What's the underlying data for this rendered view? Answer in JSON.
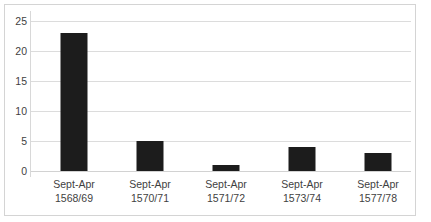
{
  "chart_data": {
    "type": "bar",
    "title": "",
    "xlabel": "",
    "ylabel": "",
    "ylim": [
      0,
      25
    ],
    "yticks": [
      0,
      5,
      10,
      15,
      20,
      25
    ],
    "grid": true,
    "legend": false,
    "categories": [
      "Sept-Apr 1568/69",
      "Sept-Apr 1570/71",
      "Sept-Apr 1571/72",
      "Sept-Apr 1573/74",
      "Sept-Apr 1577/78"
    ],
    "values": [
      23,
      5,
      1,
      4,
      3
    ],
    "bar_color": "#1c1c1c",
    "gridline_color": "#dcdcdc",
    "text_color": "#3f3f3f",
    "border_color": "#d4d4d4",
    "background_color": "#ffffff"
  },
  "axes": {
    "y_tick_labels": [
      "25",
      "20",
      "15",
      "10",
      "5",
      "0"
    ],
    "x_tick_labels": [
      {
        "line1": "Sept-Apr",
        "line2": "1568/69"
      },
      {
        "line1": "Sept-Apr",
        "line2": "1570/71"
      },
      {
        "line1": "Sept-Apr",
        "line2": "1571/72"
      },
      {
        "line1": "Sept-Apr",
        "line2": "1573/74"
      },
      {
        "line1": "Sept-Apr",
        "line2": "1577/78"
      }
    ]
  }
}
